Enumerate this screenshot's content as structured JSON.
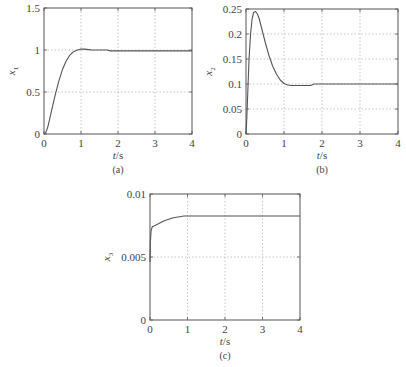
{
  "chart_data": [
    {
      "id": "a",
      "type": "line",
      "caption": "(a)",
      "title": "",
      "xlabel": "t/s",
      "ylabel": "x1",
      "ylabel_main": "x",
      "ylabel_sub": "1",
      "xlim": [
        0,
        4
      ],
      "ylim": [
        0,
        1.5
      ],
      "xticks": [
        0,
        1,
        2,
        3,
        4
      ],
      "xtick_labels": [
        "0",
        "1",
        "2",
        "3",
        "4"
      ],
      "yticks": [
        0,
        0.5,
        1,
        1.5
      ],
      "ytick_labels": [
        "0",
        "0.5",
        "1",
        "1.5"
      ],
      "grid": true,
      "legend": null,
      "series": [
        {
          "name": "x1",
          "x": [
            0,
            0.05,
            0.1,
            0.15,
            0.2,
            0.3,
            0.4,
            0.5,
            0.6,
            0.7,
            0.8,
            0.9,
            1.0,
            1.1,
            1.2,
            1.3,
            1.5,
            1.7,
            1.8,
            2.0,
            2.5,
            3.0,
            3.5,
            4.0
          ],
          "y": [
            0,
            0.02,
            0.08,
            0.17,
            0.27,
            0.46,
            0.63,
            0.77,
            0.87,
            0.94,
            0.98,
            1.0,
            1.01,
            1.01,
            1.005,
            1.0,
            1.0,
            1.0,
            0.99,
            0.99,
            0.99,
            0.99,
            0.99,
            0.99
          ]
        }
      ]
    },
    {
      "id": "b",
      "type": "line",
      "caption": "(b)",
      "title": "",
      "xlabel": "t/s",
      "ylabel": "x2",
      "ylabel_main": "x",
      "ylabel_sub": "2",
      "xlim": [
        0,
        4
      ],
      "ylim": [
        0,
        0.25
      ],
      "xticks": [
        0,
        1,
        2,
        3,
        4
      ],
      "xtick_labels": [
        "0",
        "1",
        "2",
        "3",
        "4"
      ],
      "yticks": [
        0,
        0.05,
        0.1,
        0.15,
        0.2,
        0.25
      ],
      "ytick_labels": [
        "0",
        "0.05",
        "0.1",
        "0.15",
        "0.2",
        "0.25"
      ],
      "grid": true,
      "legend": null,
      "series": [
        {
          "name": "x2",
          "x": [
            0,
            0.02,
            0.05,
            0.08,
            0.12,
            0.16,
            0.2,
            0.25,
            0.3,
            0.35,
            0.4,
            0.5,
            0.6,
            0.7,
            0.8,
            0.9,
            1.0,
            1.1,
            1.2,
            1.4,
            1.7,
            1.8,
            2.0,
            2.5,
            3.0,
            3.5,
            4.0
          ],
          "y": [
            0,
            0.03,
            0.09,
            0.15,
            0.2,
            0.23,
            0.243,
            0.245,
            0.24,
            0.23,
            0.215,
            0.185,
            0.158,
            0.136,
            0.12,
            0.108,
            0.101,
            0.098,
            0.097,
            0.097,
            0.097,
            0.1,
            0.1,
            0.1,
            0.1,
            0.1,
            0.1
          ]
        }
      ]
    },
    {
      "id": "c",
      "type": "line",
      "caption": "(c)",
      "title": "",
      "xlabel": "t/s",
      "ylabel": "x3",
      "ylabel_main": "x",
      "ylabel_sub": "3",
      "xlim": [
        0,
        4
      ],
      "ylim": [
        0,
        0.01
      ],
      "xticks": [
        0,
        1,
        2,
        3,
        4
      ],
      "xtick_labels": [
        "0",
        "1",
        "2",
        "3",
        "4"
      ],
      "yticks": [
        0,
        0.005,
        0.01
      ],
      "ytick_labels": [
        "0",
        "0.005",
        "0.01"
      ],
      "grid": true,
      "legend": null,
      "series": [
        {
          "name": "x3",
          "x": [
            0,
            0.01,
            0.03,
            0.06,
            0.1,
            0.2,
            0.3,
            0.4,
            0.5,
            0.6,
            0.7,
            0.8,
            0.9,
            1.0,
            2.0,
            3.0,
            4.0
          ],
          "y": [
            0.0046,
            0.0062,
            0.0071,
            0.0074,
            0.00745,
            0.0076,
            0.00775,
            0.0079,
            0.008,
            0.0081,
            0.00815,
            0.0082,
            0.00825,
            0.00825,
            0.00825,
            0.00825,
            0.00825
          ]
        }
      ]
    }
  ],
  "figure": {
    "colors": {
      "line": "#555555",
      "axis": "#555555",
      "grid": "#b8b8b8",
      "text": "#444444",
      "background": "#ffffff"
    }
  }
}
